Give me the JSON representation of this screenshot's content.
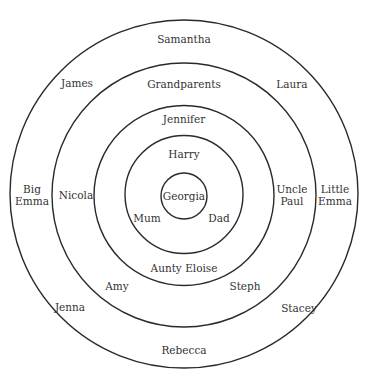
{
  "diagram": {
    "type": "concentric-circles",
    "center": {
      "x": 184,
      "y": 196
    },
    "stroke_color": "#2a2a2a",
    "text_color": "#333333",
    "rings": [
      {
        "name": "outer",
        "r": 172
      },
      {
        "name": "ring-2",
        "r": 131
      },
      {
        "name": "ring-3",
        "r": 90
      },
      {
        "name": "ring-4",
        "r": 59
      },
      {
        "name": "inner",
        "r": 23
      }
    ],
    "labels": {
      "center": "Georgia",
      "ring4": {
        "left": "Mum",
        "right": "Dad",
        "top": "Harry"
      },
      "ring3": {
        "top": "Jennifer",
        "bottom": "Aunty Eloise",
        "right_1": "Uncle",
        "right_2": "Paul",
        "left": "Nicola"
      },
      "ring2": {
        "top": "Grandparents",
        "top_left": "James",
        "bottom_left": "Amy",
        "bottom_right": "Steph"
      },
      "outer": {
        "top": "Samantha",
        "top_right": "Laura",
        "left_1": "Big",
        "left_2": "Emma",
        "right_1": "Little",
        "right_2": "Emma",
        "bottom_left": "Jenna",
        "bottom_right": "Stacey",
        "bottom": "Rebecca"
      }
    }
  }
}
